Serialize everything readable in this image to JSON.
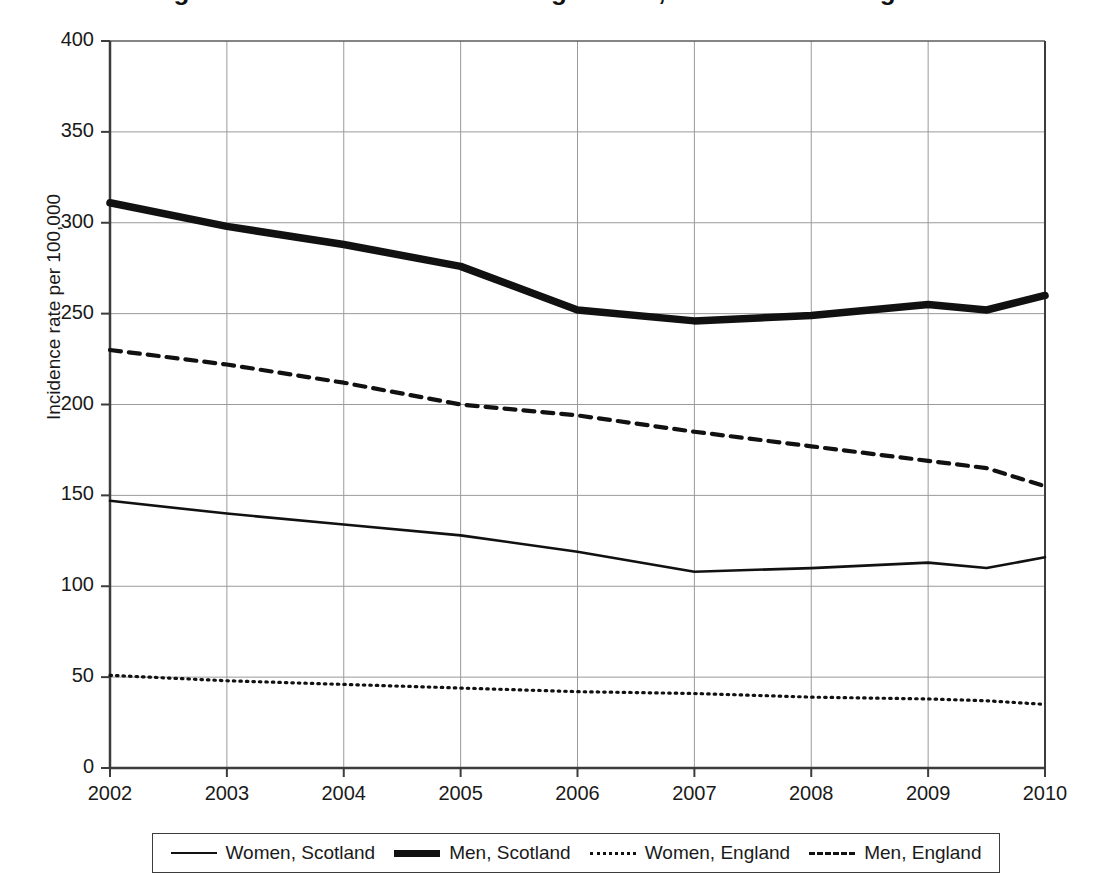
{
  "figure": {
    "title_partial": "Figure 1: Incidence rates for lung cancer, Scotland and England",
    "title_visible": false
  },
  "axes": {
    "y_title": "Incidence rate per 100,000",
    "y_ticks": [
      0,
      50,
      100,
      150,
      200,
      250,
      300,
      350,
      400
    ],
    "x_ticks": [
      "2002",
      "2003",
      "2004",
      "2005",
      "2006",
      "2007",
      "2008",
      "2009",
      "2010"
    ]
  },
  "legend": {
    "items": [
      {
        "label": "Women, Scotland",
        "style": "solid-thin"
      },
      {
        "label": "Men, Scotland",
        "style": "solid-thick"
      },
      {
        "label": "Women, England",
        "style": "dotted"
      },
      {
        "label": "Men, England",
        "style": "dashed"
      }
    ]
  },
  "chart_data": {
    "type": "line",
    "title": "",
    "xlabel": "",
    "ylabel": "Incidence rate per 100,000",
    "xlim": [
      2002,
      2010
    ],
    "ylim": [
      0,
      400
    ],
    "ytick_step": 50,
    "grid": true,
    "legend_position": "bottom",
    "x": [
      2002,
      2003,
      2004,
      2005,
      2006,
      2007,
      2008,
      2009,
      2009.5,
      2010
    ],
    "series": [
      {
        "name": "Men, Scotland",
        "style": "solid-thick",
        "color": "#111111",
        "values": [
          311,
          298,
          288,
          276,
          252,
          246,
          249,
          255,
          252,
          260
        ]
      },
      {
        "name": "Men, England",
        "style": "dashed",
        "color": "#111111",
        "values": [
          230,
          222,
          212,
          200,
          194,
          185,
          177,
          169,
          165,
          155
        ]
      },
      {
        "name": "Women, Scotland",
        "style": "solid-thin",
        "color": "#111111",
        "values": [
          147,
          140,
          134,
          128,
          119,
          108,
          110,
          113,
          110,
          116
        ]
      },
      {
        "name": "Women, England",
        "style": "dotted",
        "color": "#111111",
        "values": [
          51,
          48,
          46,
          44,
          42,
          41,
          39,
          38,
          37,
          35
        ]
      }
    ]
  },
  "colors": {
    "line": "#111111",
    "grid": "#9a9a9a",
    "axis": "#3c3c3c",
    "background": "#ffffff"
  }
}
